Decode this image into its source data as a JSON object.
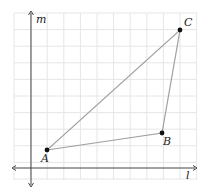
{
  "diagram": {
    "type": "coordinate-plane-triangle",
    "grid": {
      "x_start": 14,
      "x_end": 197,
      "y_start": 13,
      "y_end": 180,
      "spacing": 16.6,
      "color": "#e6e6e6"
    },
    "axes": {
      "horizontal": {
        "label": "l",
        "y": 168,
        "x1": 12,
        "x2": 197
      },
      "vertical": {
        "label": "m",
        "x": 31,
        "y1": 11,
        "y2": 187
      },
      "color": "#444444"
    },
    "triangle": {
      "edge_color": "#a0a0a0",
      "point_color": "#111111",
      "points": [
        {
          "name": "A",
          "x": 47,
          "y": 150,
          "label_dx": -6,
          "label_dy": 12
        },
        {
          "name": "B",
          "x": 162,
          "y": 133,
          "label_dx": 1,
          "label_dy": 12
        },
        {
          "name": "C",
          "x": 180,
          "y": 30,
          "label_dx": 4,
          "label_dy": -4
        }
      ]
    }
  }
}
